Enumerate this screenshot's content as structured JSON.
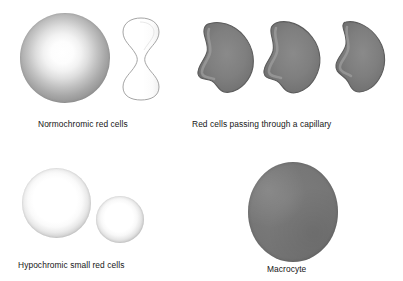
{
  "figure": {
    "background_color": "#ffffff",
    "panels": [
      {
        "id": "normochromic",
        "caption": "Normochromic red cells",
        "shapes": [
          {
            "name": "normochromic-cell-face-view",
            "form": "circle",
            "fill": "radial pale-centre grey"
          },
          {
            "name": "normochromic-cell-side-view",
            "form": "biconcave-outline",
            "fill": "white with grey outline"
          }
        ]
      },
      {
        "id": "capillary",
        "caption": "Red cells passing through a capillary",
        "shapes": [
          {
            "name": "capillary-cell-1",
            "form": "bullet-deformed",
            "fill": "uniform grey"
          },
          {
            "name": "capillary-cell-2",
            "form": "bullet-deformed",
            "fill": "uniform grey"
          },
          {
            "name": "capillary-cell-3",
            "form": "bullet-deformed",
            "fill": "uniform grey"
          }
        ]
      },
      {
        "id": "hypochromic",
        "caption": "Hypochromic small red cells",
        "shapes": [
          {
            "name": "hypochromic-cell-large",
            "form": "circle",
            "fill": "wide pale centre, thin grey rim"
          },
          {
            "name": "hypochromic-cell-small",
            "form": "circle",
            "fill": "wide pale centre, thin grey rim"
          }
        ]
      },
      {
        "id": "macrocyte",
        "caption": "Macrocyte",
        "shapes": [
          {
            "name": "macrocyte-cell",
            "form": "oval",
            "fill": "uniform dark grey"
          }
        ]
      }
    ],
    "colors": {
      "background": "#ffffff",
      "caption_text": "#161616",
      "cell_outline": "#8d8d8d",
      "capillary_cell_fill": "#7a7a7a",
      "capillary_cell_rim": "#5e5e5e",
      "macrocyte_fill": "#767676",
      "pale_centre": "#ffffff"
    }
  }
}
